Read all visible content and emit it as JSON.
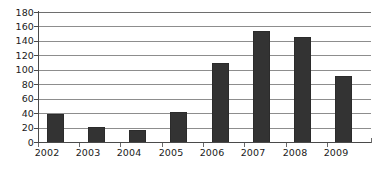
{
  "chart_data": {
    "type": "bar",
    "title": "",
    "subtitle": "",
    "xlabel": "",
    "ylabel": "",
    "categories": [
      "2002",
      "2003",
      "2004",
      "2005",
      "2006",
      "2007",
      "2008",
      "2009"
    ],
    "values": [
      39,
      21,
      16,
      41,
      110,
      154,
      146,
      92
    ],
    "series": [
      {
        "name": "",
        "values": [
          39,
          21,
          16,
          41,
          110,
          154,
          146,
          92
        ]
      }
    ],
    "ylim": [
      0,
      180
    ],
    "ytick_labels": [
      "0",
      "20",
      "40",
      "60",
      "80",
      "100",
      "120",
      "140",
      "160",
      "180"
    ],
    "ytick_values": [
      0,
      20,
      40,
      60,
      80,
      100,
      120,
      140,
      160,
      180
    ],
    "ytick_step": 20,
    "grid": true,
    "grid_axis": "y",
    "legend": false,
    "legend_position": "none",
    "annotations": [],
    "colors": {
      "bar": "#333333",
      "gridline": "#8d8d8d",
      "axis": "#4a4a4a",
      "text": "#1a1a1a",
      "background": "#ffffff"
    }
  }
}
